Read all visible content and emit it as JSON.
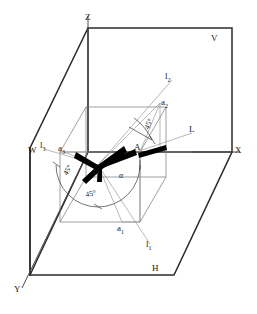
{
  "figure": {
    "background_color": "#ffffff",
    "line_color": "#2b2b2b",
    "thin_color": "#6e6e6e",
    "vector_color": "#000000"
  },
  "plane_labels": {
    "v_plane": "V",
    "h_plane": "H",
    "w_plane": "W"
  },
  "axis_labels": {
    "z_axis": "Z",
    "x_axis": "X",
    "y_axis": "Y"
  },
  "point_labels": {
    "origin": "O",
    "point_a": "A",
    "proj_a1": "a",
    "proj_a1_sub": "1",
    "proj_a2": "a",
    "proj_a2_sub": "2",
    "proj_a3": "a",
    "proj_a3_sub": "3"
  },
  "line_labels": {
    "line_l": "L",
    "proj_l1": "l",
    "proj_l1_sub": "1",
    "proj_l2": "l",
    "proj_l2_sub": "2",
    "proj_l3": "l",
    "proj_l3_sub": "3"
  },
  "angle_labels": {
    "alpha": "α",
    "angle_left": "45°",
    "angle_bottom": "45°",
    "angle_upper": "45°"
  },
  "geometry": {
    "origin_px": [
      98,
      165
    ],
    "point_a_px": [
      140,
      152
    ],
    "a1_px": [
      122,
      222
    ],
    "a2_px": [
      160,
      103
    ],
    "a3_px": [
      64,
      152
    ],
    "outer_v_plane": [
      [
        88,
        28
      ],
      [
        232,
        28
      ],
      [
        232,
        152
      ],
      [
        88,
        152
      ]
    ],
    "inner_cube_front": [
      [
        60,
        152
      ],
      [
        60,
        222
      ],
      [
        140,
        222
      ],
      [
        140,
        152
      ]
    ],
    "inner_cube_back": [
      [
        86,
        107
      ],
      [
        86,
        177
      ],
      [
        166,
        177
      ],
      [
        166,
        107
      ]
    ]
  }
}
